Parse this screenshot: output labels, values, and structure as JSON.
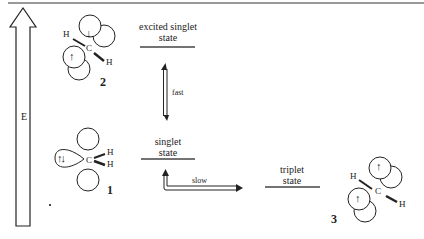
{
  "diagram": {
    "axis": {
      "label": "E"
    },
    "states": {
      "excited_singlet": {
        "line1": "excited  singlet",
        "line2": "state"
      },
      "singlet": {
        "line1": "singlet",
        "line2": "state"
      },
      "triplet": {
        "line1": "triplet",
        "line2": "state"
      }
    },
    "transitions": {
      "fast": "fast",
      "slow": "slow"
    },
    "molecules": {
      "m1": {
        "number": "1",
        "atoms": {
          "c": "C",
          "h1": "H",
          "h2": "H"
        },
        "electrons": "↑↓"
      },
      "m2": {
        "number": "2",
        "atoms": {
          "c": "C",
          "h1": "H",
          "h2": "H"
        },
        "electrons": [
          "↓",
          "↑"
        ]
      },
      "m3": {
        "number": "3",
        "atoms": {
          "c": "C",
          "h1": "H",
          "h2": "H"
        },
        "electrons": [
          "↑",
          "↑"
        ]
      }
    }
  }
}
